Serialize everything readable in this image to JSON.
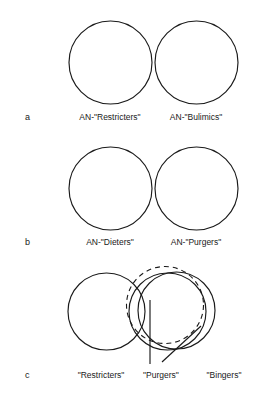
{
  "figure": {
    "title": "",
    "background_color": "#ffffff",
    "stroke_color": "#1a1a1a",
    "panels": [
      {
        "letter": "a",
        "letter_x": 25,
        "letter_y": 117,
        "labels": [
          {
            "text": "AN-\"Restricters\"",
            "x": 110,
            "y": 117
          },
          {
            "text": "AN-\"Bulimics\"",
            "x": 196,
            "y": 117
          }
        ],
        "shapes": [
          {
            "kind": "circle",
            "cx": 110.5,
            "cy": 62.5,
            "r": 41.5,
            "dashed": false
          },
          {
            "kind": "circle",
            "cx": 196.5,
            "cy": 62.5,
            "r": 41.5,
            "dashed": false
          }
        ]
      },
      {
        "letter": "b",
        "letter_x": 25,
        "letter_y": 242,
        "labels": [
          {
            "text": "AN-\"Dieters\"",
            "x": 110,
            "y": 242
          },
          {
            "text": "AN-\"Purgers\"",
            "x": 196,
            "y": 242
          }
        ],
        "shapes": [
          {
            "kind": "circle",
            "cx": 110.5,
            "cy": 188.5,
            "r": 41.5,
            "dashed": false
          },
          {
            "kind": "circle",
            "cx": 196.5,
            "cy": 188.5,
            "r": 41.5,
            "dashed": false
          }
        ]
      },
      {
        "letter": "c",
        "letter_x": 25,
        "letter_y": 375,
        "labels": [
          {
            "text": "\"Restricters\"",
            "x": 101,
            "y": 375
          },
          {
            "text": "\"Purgers\"",
            "x": 161,
            "y": 375
          },
          {
            "text": "\"Bingers\"",
            "x": 224,
            "y": 375
          }
        ],
        "shapes": [
          {
            "kind": "circle",
            "cx": 106.5,
            "cy": 311.5,
            "r": 38.5,
            "dashed": false
          },
          {
            "kind": "circle",
            "cx": 167.5,
            "cy": 311.5,
            "r": 38.5,
            "dashed": false
          },
          {
            "kind": "circle",
            "cx": 176.5,
            "cy": 310.5,
            "r": 38.5,
            "dashed": false
          },
          {
            "kind": "circle",
            "cx": 165.0,
            "cy": 305.0,
            "r": 38.5,
            "dashed": true
          }
        ],
        "pointers": [
          {
            "kind": "line",
            "x1": 150,
            "y1": 300,
            "x2": 150,
            "y2": 364
          },
          {
            "kind": "line",
            "x1": 162,
            "y1": 362,
            "x2": 201,
            "y2": 326
          }
        ]
      }
    ]
  }
}
